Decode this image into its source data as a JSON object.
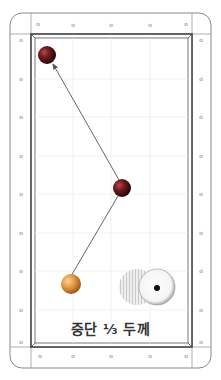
{
  "diagram": {
    "caption": "중단 ⅓ 두께",
    "colors": {
      "rail_line": "#777777",
      "cushion_line": "#444444",
      "grid_line": "#eeeeee",
      "object_ball_dark": "#7a1f24",
      "cue_ball_yellow": "#e8a64a",
      "path_line": "#555555"
    },
    "balls": [
      {
        "name": "target-ball-top-left",
        "cx": 47,
        "cy": 55,
        "r": 9,
        "color": "dark-red"
      },
      {
        "name": "object-ball-center",
        "cx": 122,
        "cy": 188,
        "r": 9,
        "color": "dark-red"
      },
      {
        "name": "cue-ball-bottom",
        "cx": 71,
        "cy": 284,
        "r": 10,
        "color": "yellow"
      }
    ],
    "thickness_indicator": {
      "label": "1/3 thickness",
      "hatched_ball": {
        "cx": 148,
        "cy": 287,
        "r": 18
      },
      "white_ball": {
        "cx": 157,
        "cy": 287,
        "r": 18
      }
    },
    "diamonds": {
      "top": 5,
      "bottom": 5,
      "left": 9,
      "right": 9
    }
  }
}
